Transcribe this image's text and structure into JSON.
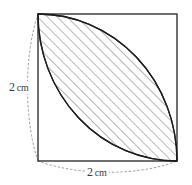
{
  "figure": {
    "caption_fragment": "",
    "square": {
      "side_label": "2 cm",
      "stroke_color": "#333333"
    },
    "dimensions": [
      {
        "id": "left-side",
        "value": "2",
        "unit": "cm",
        "full_label": "2 cm",
        "position": "left",
        "guide_style": "dotted-arc"
      },
      {
        "id": "bottom-side",
        "value": "2",
        "unit": "cm",
        "full_label": "2 cm",
        "position": "bottom",
        "guide_style": "dotted-arc"
      }
    ],
    "shaded_region": {
      "name": "lens",
      "description": "vesica formed by two quarter-circle arcs",
      "fill_pattern": "diagonal-hatch",
      "hatch_color": "#7a7a7a",
      "hatch_angle_deg": 45,
      "outline_color": "#1c1c1c"
    },
    "arcs": [
      {
        "id": "arc-from-top-left",
        "center": "top-left-corner",
        "radius_label": "2 cm"
      },
      {
        "id": "arc-from-bottom-right",
        "center": "bottom-right-corner",
        "radius_label": "2 cm"
      }
    ],
    "guides": {
      "color": "#9a9a9a",
      "style": "dotted"
    }
  }
}
